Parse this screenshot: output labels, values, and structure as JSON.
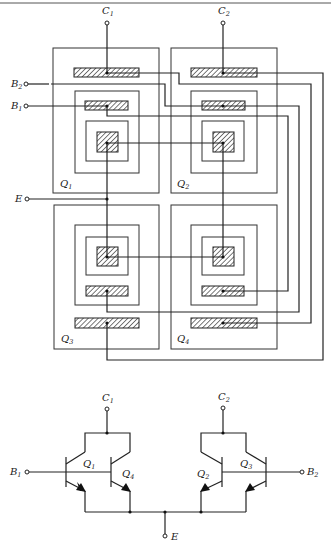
{
  "figure": {
    "type": "integrated circuit layout and schematic of a four-transistor cross-coupled differential pair",
    "top_rule": true
  },
  "layout": {
    "terminals": {
      "c1": {
        "label": "C",
        "sub": "1"
      },
      "c2": {
        "label": "C",
        "sub": "2"
      },
      "b1": {
        "label": "B",
        "sub": "1"
      },
      "b2": {
        "label": "B",
        "sub": "2"
      },
      "e": {
        "label": "E",
        "sub": ""
      }
    },
    "transistors": [
      {
        "id": "q1",
        "label": "Q",
        "sub": "1",
        "position": "top-left"
      },
      {
        "id": "q2",
        "label": "Q",
        "sub": "2",
        "position": "top-right"
      },
      {
        "id": "q3",
        "label": "Q",
        "sub": "3",
        "position": "bottom-left"
      },
      {
        "id": "q4",
        "label": "Q",
        "sub": "4",
        "position": "bottom-right"
      }
    ],
    "connections": [
      {
        "from": "C1",
        "to": [
          "Q1 collector",
          "Q4 collector"
        ]
      },
      {
        "from": "C2",
        "to": [
          "Q2 collector",
          "Q3 collector"
        ]
      },
      {
        "from": "B1",
        "to": [
          "Q1 base",
          "Q4 base"
        ]
      },
      {
        "from": "B2",
        "to": [
          "Q2 base",
          "Q3 base"
        ]
      },
      {
        "from": "E",
        "to": [
          "Q1 emitter",
          "Q2 emitter",
          "Q3 emitter",
          "Q4 emitter"
        ]
      }
    ]
  },
  "schematic": {
    "terminals": {
      "c1": {
        "label": "C",
        "sub": "1"
      },
      "c2": {
        "label": "C",
        "sub": "2"
      },
      "b1": {
        "label": "B",
        "sub": "1"
      },
      "b2": {
        "label": "B",
        "sub": "2"
      },
      "e": {
        "label": "E",
        "sub": ""
      }
    },
    "transistors": [
      {
        "label": "Q",
        "sub": "1"
      },
      {
        "label": "Q",
        "sub": "4"
      },
      {
        "label": "Q",
        "sub": "2"
      },
      {
        "label": "Q",
        "sub": "3"
      }
    ]
  }
}
